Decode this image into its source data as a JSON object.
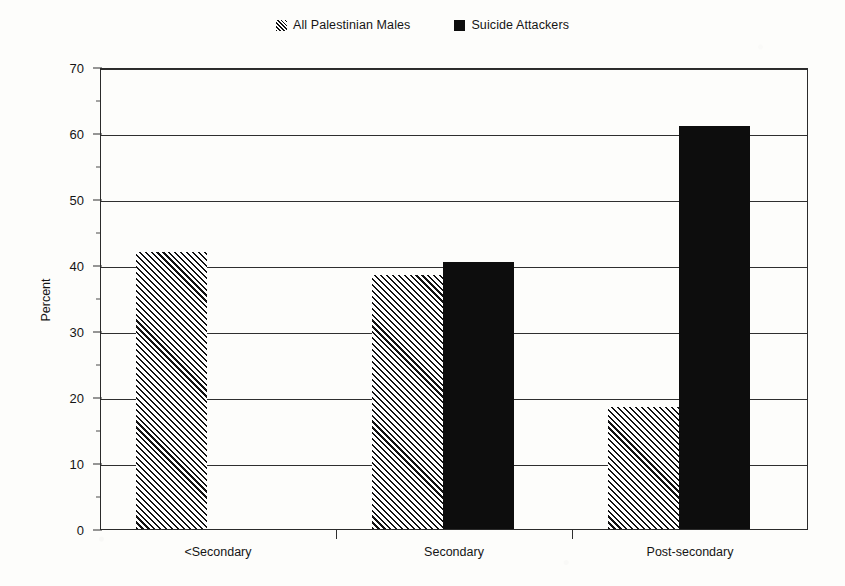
{
  "chart_data": {
    "type": "bar",
    "title": "",
    "subtitle": "",
    "xlabel": "",
    "ylabel": "Percent",
    "categories": [
      "<Secondary",
      "Secondary",
      "Post-secondary"
    ],
    "series": [
      {
        "name": "All Palestinian Males",
        "swatch": "hatch",
        "values": [
          42,
          38.5,
          18.5
        ]
      },
      {
        "name": "Suicide Attackers",
        "swatch": "solid",
        "values": [
          null,
          40.5,
          61
        ]
      }
    ],
    "ylim": [
      0,
      70
    ],
    "yticks": [
      0,
      10,
      20,
      30,
      40,
      50,
      60,
      70
    ],
    "ytick_labels": [
      "0",
      "10",
      "20",
      "30",
      "40",
      "50",
      "60",
      "70"
    ],
    "grid": "horizontal",
    "legend_position": "top-center",
    "colors": {
      "series_1_fill": "#ffffff",
      "series_1_hatch": "#121212",
      "series_2_fill": "#0d0d0d",
      "axis": "#2f2f2f",
      "text": "#151515",
      "background": "#fdfdfb"
    }
  },
  "legend": {
    "entries": [
      {
        "label": "All Palestinian Males",
        "swatch": "hatch"
      },
      {
        "label": "Suicide Attackers",
        "swatch": "solid"
      }
    ]
  },
  "axis": {
    "y_title": "Percent",
    "y_labels": [
      "70",
      "60",
      "50",
      "40",
      "30",
      "20",
      "10",
      "0"
    ],
    "x_labels": [
      "<Secondary",
      "Secondary",
      "Post-secondary"
    ]
  }
}
